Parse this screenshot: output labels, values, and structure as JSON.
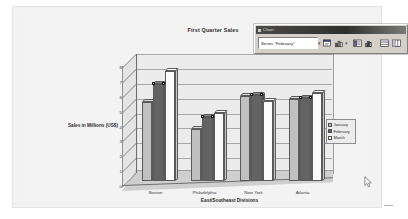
{
  "window": {
    "background": "#ffffff",
    "paper_background": "#f2f2f2"
  },
  "toolbar": {
    "title": "Chart",
    "grip_name": "toolbar-grip",
    "series_combo_value": "Series \"February\"",
    "dropdown_arrow": "▾",
    "buttons": [
      {
        "name": "format-data-series-button",
        "icon": "format-dialog-icon",
        "tooltip": "Format Data Series"
      },
      {
        "name": "chart-type-button",
        "icon": "chart-type-icon",
        "tooltip": "Chart Type"
      },
      {
        "name": "legend-button",
        "icon": "legend-icon",
        "tooltip": "Legend"
      },
      {
        "name": "data-table-button",
        "icon": "data-table-icon",
        "tooltip": "Data Table"
      },
      {
        "name": "by-row-button",
        "icon": "by-row-icon",
        "tooltip": "By Row"
      },
      {
        "name": "by-column-button",
        "icon": "by-column-icon",
        "tooltip": "By Column"
      }
    ]
  },
  "chart_data": {
    "type": "bar",
    "title": "First Quarter Sales",
    "xlabel": "East/Southeast Divisions",
    "ylabel": "Sales in Millions (US$)",
    "categories": [
      "Boston",
      "Philadelphia",
      "New York",
      "Atlanta"
    ],
    "series": [
      {
        "name": "January",
        "values": [
          5.3,
          3.5,
          5.7,
          5.5
        ],
        "color": "#c0c0c0"
      },
      {
        "name": "February",
        "values": [
          6.5,
          4.3,
          5.8,
          5.6
        ],
        "color": "#636363"
      },
      {
        "name": "March",
        "values": [
          7.4,
          4.6,
          5.4,
          5.9
        ],
        "color": "#fbfbfb"
      }
    ],
    "ylim": [
      0,
      8
    ],
    "yticks": [
      0,
      1,
      2,
      3,
      4,
      5,
      6,
      7,
      8
    ],
    "ytick_labels": [
      "0",
      "1",
      "2",
      "3",
      "4",
      "5",
      "6",
      "7",
      "8"
    ],
    "grid": true,
    "legend_position": "right",
    "selected_series": "February",
    "three_d": true
  },
  "cursor": {
    "name": "mouse-pointer",
    "x": 364,
    "y": 176
  }
}
